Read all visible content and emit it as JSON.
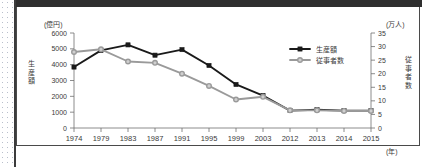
{
  "panel": {
    "left_axis_unit": "(億円)",
    "right_axis_unit": "(万人)",
    "x_axis_unit": "(年)",
    "left_axis_title": "生産額",
    "right_axis_title": "従事者数"
  },
  "legend": {
    "position": "top-right",
    "items": [
      {
        "label": "生産額",
        "color": "#1a1a1a",
        "marker": "square"
      },
      {
        "label": "従事者数",
        "color": "#9a9a9a",
        "marker": "circle"
      }
    ]
  },
  "chart_data": {
    "type": "line",
    "title": "",
    "subtitle": "",
    "xlabel": "(年)",
    "ylabel": "生産額",
    "y2label": "従事者数",
    "grid": false,
    "legend_position": "top-right",
    "categories": [
      "1974",
      "1979",
      "1983",
      "1987",
      "1991",
      "1995",
      "1999",
      "2003",
      "2012",
      "2013",
      "2014",
      "2015"
    ],
    "x_tick_labels": [
      "1974",
      "1979",
      "1983",
      "1987",
      "1991",
      "1995",
      "1999",
      "2003",
      "2012",
      "2013",
      "2014",
      "2015"
    ],
    "y_tick_labels": [
      "0",
      "1000",
      "2000",
      "3000",
      "4000",
      "5000",
      "6000"
    ],
    "y2_tick_labels": [
      "0",
      "5",
      "10",
      "15",
      "20",
      "25",
      "30",
      "35"
    ],
    "ylim": [
      0,
      6000
    ],
    "y2lim": [
      0,
      35
    ],
    "y_unit": "億円",
    "y2_unit": "万人",
    "series": [
      {
        "name": "生産額",
        "axis": "left",
        "unit": "億円",
        "color": "#1a1a1a",
        "marker": "square",
        "values": [
          3850,
          4900,
          5250,
          4600,
          4950,
          3950,
          2750,
          2050,
          1100,
          1150,
          1100,
          1100
        ]
      },
      {
        "name": "従事者数",
        "axis": "right",
        "unit": "万人",
        "color": "#9a9a9a",
        "marker": "circle",
        "values": [
          28.0,
          29.0,
          24.5,
          24.0,
          20.0,
          15.5,
          10.5,
          11.5,
          6.5,
          6.5,
          6.3,
          6.3
        ]
      }
    ]
  }
}
